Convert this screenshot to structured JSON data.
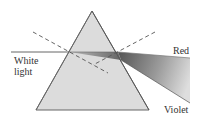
{
  "diagram": {
    "labels": {
      "white_light": "White light",
      "red": "Red",
      "violet": "Violet"
    },
    "colors": {
      "prism_fill": "#dcdcdc",
      "prism_stroke": "#666666",
      "ray": "#555555",
      "normal_dash": "#555555",
      "fan_dark": "#555555",
      "fan_light": "#d8d8d8",
      "text": "#333333"
    },
    "prism": {
      "apex": [
        92,
        11
      ],
      "bottom_left": [
        36,
        110
      ],
      "bottom_right": [
        149,
        110
      ]
    },
    "incident_ray": {
      "from": [
        11,
        52
      ],
      "to": [
        69,
        52
      ]
    },
    "entry_point": [
      69,
      52
    ],
    "exit_point": [
      118,
      52
    ],
    "normals": [
      {
        "name": "entry-normal",
        "from": [
          33,
          32
        ],
        "to": [
          108,
          73
        ]
      },
      {
        "name": "exit-normal",
        "from": [
          155,
          32
        ],
        "to": [
          93,
          65
        ]
      }
    ],
    "dispersed": {
      "red_end": [
        190,
        58
      ],
      "violet_end": [
        190,
        103
      ]
    }
  }
}
